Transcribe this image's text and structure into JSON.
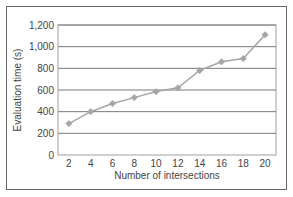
{
  "chart_data": {
    "type": "line",
    "title": "",
    "xlabel": "Number of intersections",
    "ylabel": "Evaluation time (s)",
    "x": [
      2,
      4,
      6,
      8,
      10,
      12,
      14,
      16,
      18,
      20
    ],
    "series": [
      {
        "name": "Evaluation time",
        "values": [
          290,
          400,
          475,
          530,
          585,
          620,
          780,
          860,
          890,
          1110
        ],
        "color": "#a6a6a6",
        "marker": "diamond"
      }
    ],
    "x_tick_labels": [
      "2",
      "4",
      "6",
      "8",
      "10",
      "12",
      "14",
      "16",
      "18",
      "20"
    ],
    "y_tick_labels": [
      "0",
      "200",
      "400",
      "600",
      "800",
      "1,000",
      "1,200"
    ],
    "y_ticks": [
      0,
      200,
      400,
      600,
      800,
      1000,
      1200
    ],
    "ylim": [
      0,
      1200
    ],
    "grid": true,
    "legend": false
  },
  "labels": {
    "xlabel": "Number of intersections",
    "ylabel": "Evaluation time (s)"
  }
}
